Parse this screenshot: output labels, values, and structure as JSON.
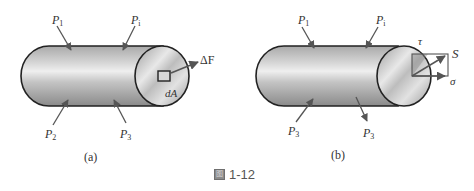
{
  "figure": {
    "caption_icon": "figure-icon",
    "caption_icon_glyph": "图",
    "caption_number": "1-12"
  },
  "panel_a": {
    "caption": "(a)",
    "forces": [
      {
        "symbol": "P",
        "subscript": "1"
      },
      {
        "symbol": "P",
        "subscript": "i"
      },
      {
        "symbol": "P",
        "subscript": "2"
      },
      {
        "symbol": "P",
        "subscript": "3"
      }
    ],
    "area_label": "dA",
    "force_increment_label": "ΔF"
  },
  "panel_b": {
    "caption": "(b)",
    "forces": [
      {
        "symbol": "P",
        "subscript": "1"
      },
      {
        "symbol": "P",
        "subscript": "i"
      },
      {
        "symbol": "P",
        "subscript": "3"
      },
      {
        "symbol": "P",
        "subscript": "3"
      }
    ],
    "shear_label": "τ",
    "stress_label": "S",
    "normal_label": "σ"
  },
  "colors": {
    "outline": "#222222",
    "arrow": "#555555",
    "body_light": "#e6e6e6",
    "body_dark": "#8c8c8c"
  }
}
